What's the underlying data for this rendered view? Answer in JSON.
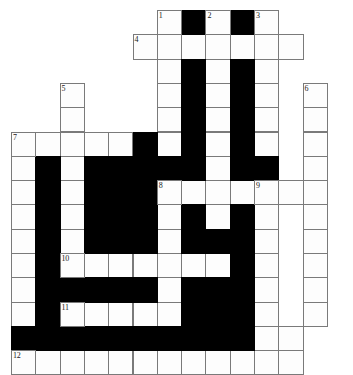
{
  "puzzle": {
    "title": "Crossword Puzzle Grid",
    "type": "crossword-grid",
    "grid_origin": {
      "x": 11,
      "y": 10
    },
    "cell_size": 24.3,
    "colors": {
      "white_cell": "#fdfdfd",
      "black_cell": "#000000",
      "grid_line": "#7a7a7a",
      "number_text": "#1a1a1a",
      "background": "#ffffff"
    },
    "columns": 14,
    "rows": 14,
    "cells": [
      {
        "r": 0,
        "c": 6,
        "t": "w",
        "n": "1"
      },
      {
        "r": 0,
        "c": 7,
        "t": "b",
        "n": ""
      },
      {
        "r": 0,
        "c": 8,
        "t": "w",
        "n": "2"
      },
      {
        "r": 0,
        "c": 9,
        "t": "b",
        "n": ""
      },
      {
        "r": 0,
        "c": 10,
        "t": "w",
        "n": "3"
      },
      {
        "r": 1,
        "c": 5,
        "t": "w",
        "n": "4"
      },
      {
        "r": 1,
        "c": 6,
        "t": "w",
        "n": ""
      },
      {
        "r": 1,
        "c": 7,
        "t": "w",
        "n": ""
      },
      {
        "r": 1,
        "c": 8,
        "t": "w",
        "n": ""
      },
      {
        "r": 1,
        "c": 9,
        "t": "w",
        "n": ""
      },
      {
        "r": 1,
        "c": 10,
        "t": "w",
        "n": ""
      },
      {
        "r": 1,
        "c": 11,
        "t": "w",
        "n": ""
      },
      {
        "r": 2,
        "c": 6,
        "t": "w",
        "n": ""
      },
      {
        "r": 2,
        "c": 7,
        "t": "b",
        "n": ""
      },
      {
        "r": 2,
        "c": 8,
        "t": "w",
        "n": ""
      },
      {
        "r": 2,
        "c": 9,
        "t": "b",
        "n": ""
      },
      {
        "r": 2,
        "c": 10,
        "t": "w",
        "n": ""
      },
      {
        "r": 3,
        "c": 2,
        "t": "w",
        "n": "5"
      },
      {
        "r": 3,
        "c": 6,
        "t": "w",
        "n": ""
      },
      {
        "r": 3,
        "c": 7,
        "t": "b",
        "n": ""
      },
      {
        "r": 3,
        "c": 8,
        "t": "w",
        "n": ""
      },
      {
        "r": 3,
        "c": 9,
        "t": "b",
        "n": ""
      },
      {
        "r": 3,
        "c": 10,
        "t": "w",
        "n": ""
      },
      {
        "r": 3,
        "c": 12,
        "t": "w",
        "n": "6"
      },
      {
        "r": 4,
        "c": 2,
        "t": "w",
        "n": ""
      },
      {
        "r": 4,
        "c": 6,
        "t": "w",
        "n": ""
      },
      {
        "r": 4,
        "c": 7,
        "t": "b",
        "n": ""
      },
      {
        "r": 4,
        "c": 8,
        "t": "w",
        "n": ""
      },
      {
        "r": 4,
        "c": 9,
        "t": "b",
        "n": ""
      },
      {
        "r": 4,
        "c": 10,
        "t": "w",
        "n": ""
      },
      {
        "r": 4,
        "c": 12,
        "t": "w",
        "n": ""
      },
      {
        "r": 5,
        "c": 0,
        "t": "w",
        "n": "7"
      },
      {
        "r": 5,
        "c": 1,
        "t": "w",
        "n": ""
      },
      {
        "r": 5,
        "c": 2,
        "t": "w",
        "n": ""
      },
      {
        "r": 5,
        "c": 3,
        "t": "w",
        "n": ""
      },
      {
        "r": 5,
        "c": 4,
        "t": "w",
        "n": ""
      },
      {
        "r": 5,
        "c": 5,
        "t": "b",
        "n": ""
      },
      {
        "r": 5,
        "c": 6,
        "t": "w",
        "n": ""
      },
      {
        "r": 5,
        "c": 7,
        "t": "b",
        "n": ""
      },
      {
        "r": 5,
        "c": 8,
        "t": "w",
        "n": ""
      },
      {
        "r": 5,
        "c": 9,
        "t": "b",
        "n": ""
      },
      {
        "r": 5,
        "c": 10,
        "t": "w",
        "n": ""
      },
      {
        "r": 5,
        "c": 12,
        "t": "w",
        "n": ""
      },
      {
        "r": 6,
        "c": 0,
        "t": "w",
        "n": ""
      },
      {
        "r": 6,
        "c": 1,
        "t": "b",
        "n": ""
      },
      {
        "r": 6,
        "c": 2,
        "t": "w",
        "n": ""
      },
      {
        "r": 6,
        "c": 3,
        "t": "b",
        "n": ""
      },
      {
        "r": 6,
        "c": 4,
        "t": "b",
        "n": ""
      },
      {
        "r": 6,
        "c": 5,
        "t": "b",
        "n": ""
      },
      {
        "r": 6,
        "c": 6,
        "t": "b",
        "n": ""
      },
      {
        "r": 6,
        "c": 7,
        "t": "b",
        "n": ""
      },
      {
        "r": 6,
        "c": 8,
        "t": "w",
        "n": ""
      },
      {
        "r": 6,
        "c": 9,
        "t": "b",
        "n": ""
      },
      {
        "r": 6,
        "c": 10,
        "t": "b",
        "n": ""
      },
      {
        "r": 6,
        "c": 12,
        "t": "w",
        "n": ""
      },
      {
        "r": 7,
        "c": 0,
        "t": "w",
        "n": ""
      },
      {
        "r": 7,
        "c": 1,
        "t": "b",
        "n": ""
      },
      {
        "r": 7,
        "c": 2,
        "t": "w",
        "n": ""
      },
      {
        "r": 7,
        "c": 3,
        "t": "b",
        "n": ""
      },
      {
        "r": 7,
        "c": 4,
        "t": "b",
        "n": ""
      },
      {
        "r": 7,
        "c": 5,
        "t": "b",
        "n": ""
      },
      {
        "r": 7,
        "c": 6,
        "t": "w",
        "n": "8"
      },
      {
        "r": 7,
        "c": 7,
        "t": "w",
        "n": ""
      },
      {
        "r": 7,
        "c": 8,
        "t": "w",
        "n": ""
      },
      {
        "r": 7,
        "c": 9,
        "t": "w",
        "n": ""
      },
      {
        "r": 7,
        "c": 10,
        "t": "w",
        "n": "9"
      },
      {
        "r": 7,
        "c": 11,
        "t": "w",
        "n": ""
      },
      {
        "r": 7,
        "c": 12,
        "t": "w",
        "n": ""
      },
      {
        "r": 8,
        "c": 0,
        "t": "w",
        "n": ""
      },
      {
        "r": 8,
        "c": 1,
        "t": "b",
        "n": ""
      },
      {
        "r": 8,
        "c": 2,
        "t": "w",
        "n": ""
      },
      {
        "r": 8,
        "c": 3,
        "t": "b",
        "n": ""
      },
      {
        "r": 8,
        "c": 4,
        "t": "b",
        "n": ""
      },
      {
        "r": 8,
        "c": 5,
        "t": "b",
        "n": ""
      },
      {
        "r": 8,
        "c": 6,
        "t": "w",
        "n": ""
      },
      {
        "r": 8,
        "c": 7,
        "t": "b",
        "n": ""
      },
      {
        "r": 8,
        "c": 8,
        "t": "w",
        "n": ""
      },
      {
        "r": 8,
        "c": 9,
        "t": "b",
        "n": ""
      },
      {
        "r": 8,
        "c": 10,
        "t": "w",
        "n": ""
      },
      {
        "r": 8,
        "c": 12,
        "t": "w",
        "n": ""
      },
      {
        "r": 9,
        "c": 0,
        "t": "w",
        "n": ""
      },
      {
        "r": 9,
        "c": 1,
        "t": "b",
        "n": ""
      },
      {
        "r": 9,
        "c": 2,
        "t": "w",
        "n": ""
      },
      {
        "r": 9,
        "c": 3,
        "t": "b",
        "n": ""
      },
      {
        "r": 9,
        "c": 4,
        "t": "b",
        "n": ""
      },
      {
        "r": 9,
        "c": 5,
        "t": "b",
        "n": ""
      },
      {
        "r": 9,
        "c": 6,
        "t": "w",
        "n": ""
      },
      {
        "r": 9,
        "c": 7,
        "t": "b",
        "n": ""
      },
      {
        "r": 9,
        "c": 8,
        "t": "b",
        "n": ""
      },
      {
        "r": 9,
        "c": 9,
        "t": "b",
        "n": ""
      },
      {
        "r": 9,
        "c": 10,
        "t": "w",
        "n": ""
      },
      {
        "r": 9,
        "c": 12,
        "t": "w",
        "n": ""
      },
      {
        "r": 10,
        "c": 0,
        "t": "w",
        "n": ""
      },
      {
        "r": 10,
        "c": 1,
        "t": "b",
        "n": ""
      },
      {
        "r": 10,
        "c": 2,
        "t": "w",
        "n": "10"
      },
      {
        "r": 10,
        "c": 3,
        "t": "w",
        "n": ""
      },
      {
        "r": 10,
        "c": 4,
        "t": "w",
        "n": ""
      },
      {
        "r": 10,
        "c": 5,
        "t": "w",
        "n": ""
      },
      {
        "r": 10,
        "c": 6,
        "t": "w",
        "n": ""
      },
      {
        "r": 10,
        "c": 7,
        "t": "w",
        "n": ""
      },
      {
        "r": 10,
        "c": 8,
        "t": "w",
        "n": ""
      },
      {
        "r": 10,
        "c": 9,
        "t": "b",
        "n": ""
      },
      {
        "r": 10,
        "c": 10,
        "t": "w",
        "n": ""
      },
      {
        "r": 10,
        "c": 12,
        "t": "w",
        "n": ""
      },
      {
        "r": 11,
        "c": 0,
        "t": "w",
        "n": ""
      },
      {
        "r": 11,
        "c": 1,
        "t": "b",
        "n": ""
      },
      {
        "r": 11,
        "c": 2,
        "t": "b",
        "n": ""
      },
      {
        "r": 11,
        "c": 3,
        "t": "b",
        "n": ""
      },
      {
        "r": 11,
        "c": 4,
        "t": "b",
        "n": ""
      },
      {
        "r": 11,
        "c": 5,
        "t": "b",
        "n": ""
      },
      {
        "r": 11,
        "c": 6,
        "t": "w",
        "n": ""
      },
      {
        "r": 11,
        "c": 7,
        "t": "b",
        "n": ""
      },
      {
        "r": 11,
        "c": 8,
        "t": "b",
        "n": ""
      },
      {
        "r": 11,
        "c": 9,
        "t": "b",
        "n": ""
      },
      {
        "r": 11,
        "c": 10,
        "t": "w",
        "n": ""
      },
      {
        "r": 11,
        "c": 12,
        "t": "w",
        "n": ""
      },
      {
        "r": 12,
        "c": 0,
        "t": "w",
        "n": ""
      },
      {
        "r": 12,
        "c": 1,
        "t": "b",
        "n": ""
      },
      {
        "r": 12,
        "c": 2,
        "t": "w",
        "n": "11"
      },
      {
        "r": 12,
        "c": 3,
        "t": "w",
        "n": ""
      },
      {
        "r": 12,
        "c": 4,
        "t": "w",
        "n": ""
      },
      {
        "r": 12,
        "c": 5,
        "t": "w",
        "n": ""
      },
      {
        "r": 12,
        "c": 6,
        "t": "w",
        "n": ""
      },
      {
        "r": 12,
        "c": 7,
        "t": "b",
        "n": ""
      },
      {
        "r": 12,
        "c": 8,
        "t": "b",
        "n": ""
      },
      {
        "r": 12,
        "c": 9,
        "t": "b",
        "n": ""
      },
      {
        "r": 12,
        "c": 10,
        "t": "w",
        "n": ""
      },
      {
        "r": 12,
        "c": 12,
        "t": "w",
        "n": ""
      },
      {
        "r": 13,
        "c": 0,
        "t": "b",
        "n": ""
      },
      {
        "r": 13,
        "c": 1,
        "t": "b",
        "n": ""
      },
      {
        "r": 13,
        "c": 2,
        "t": "b",
        "n": ""
      },
      {
        "r": 13,
        "c": 3,
        "t": "b",
        "n": ""
      },
      {
        "r": 13,
        "c": 4,
        "t": "b",
        "n": ""
      },
      {
        "r": 13,
        "c": 5,
        "t": "b",
        "n": ""
      },
      {
        "r": 13,
        "c": 6,
        "t": "b",
        "n": ""
      },
      {
        "r": 13,
        "c": 7,
        "t": "b",
        "n": ""
      },
      {
        "r": 13,
        "c": 8,
        "t": "b",
        "n": ""
      },
      {
        "r": 13,
        "c": 9,
        "t": "b",
        "n": ""
      },
      {
        "r": 13,
        "c": 10,
        "t": "w",
        "n": ""
      },
      {
        "r": 13,
        "c": 11,
        "t": "w",
        "n": ""
      },
      {
        "r": 14,
        "c": 0,
        "t": "w",
        "n": "12"
      },
      {
        "r": 14,
        "c": 1,
        "t": "w",
        "n": ""
      },
      {
        "r": 14,
        "c": 2,
        "t": "w",
        "n": ""
      },
      {
        "r": 14,
        "c": 3,
        "t": "w",
        "n": ""
      },
      {
        "r": 14,
        "c": 4,
        "t": "w",
        "n": ""
      },
      {
        "r": 14,
        "c": 5,
        "t": "w",
        "n": ""
      },
      {
        "r": 14,
        "c": 6,
        "t": "w",
        "n": ""
      },
      {
        "r": 14,
        "c": 7,
        "t": "w",
        "n": ""
      },
      {
        "r": 14,
        "c": 8,
        "t": "w",
        "n": ""
      },
      {
        "r": 14,
        "c": 9,
        "t": "w",
        "n": ""
      },
      {
        "r": 14,
        "c": 10,
        "t": "w",
        "n": ""
      },
      {
        "r": 14,
        "c": 11,
        "t": "w",
        "n": ""
      }
    ],
    "clue_numbers": [
      "1",
      "2",
      "3",
      "4",
      "5",
      "6",
      "7",
      "8",
      "9",
      "10",
      "11",
      "12"
    ]
  }
}
